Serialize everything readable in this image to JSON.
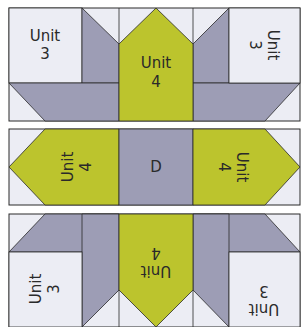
{
  "colors": {
    "light": "#ecedf4",
    "gray": "#9d9db5",
    "green": "#bcc42d",
    "line": "#2a2a2a"
  },
  "top_row": {
    "left_unit": [
      "Unit",
      "3"
    ],
    "center_unit": [
      "Unit",
      "4"
    ],
    "right_unit": [
      "Unit",
      "3"
    ]
  },
  "middle_row": {
    "left_unit": [
      "Unit",
      "4"
    ],
    "center_label": "D",
    "right_unit": [
      "Unit",
      "4"
    ]
  },
  "bottom_row": {
    "left_unit": [
      "Unit",
      "3"
    ],
    "center_unit": [
      "Unit",
      "4"
    ],
    "right_unit": [
      "Unit",
      "3"
    ]
  }
}
